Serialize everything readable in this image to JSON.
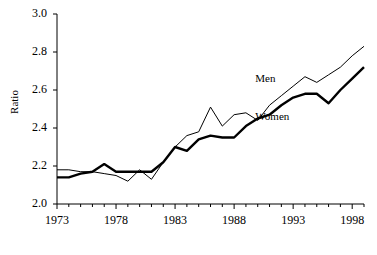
{
  "chart_data": {
    "type": "line",
    "title": "",
    "xlabel": "",
    "ylabel": "Ratio",
    "xlim": [
      1973,
      1999
    ],
    "ylim": [
      2.0,
      3.0
    ],
    "grid": false,
    "legend_position": "inline-annotation",
    "x": [
      1973,
      1974,
      1975,
      1976,
      1977,
      1978,
      1979,
      1980,
      1981,
      1982,
      1983,
      1984,
      1985,
      1986,
      1987,
      1988,
      1989,
      1990,
      1991,
      1992,
      1993,
      1994,
      1995,
      1996,
      1997,
      1998,
      1999
    ],
    "yticks": [
      "2.0",
      "2.2",
      "2.4",
      "2.6",
      "2.8",
      "3.0"
    ],
    "ytick_values": [
      2.0,
      2.2,
      2.4,
      2.6,
      2.8,
      3.0
    ],
    "xticks": [
      "1973",
      "1978",
      "1983",
      "1988",
      "1993",
      "1998"
    ],
    "xtick_values": [
      1973,
      1978,
      1983,
      1988,
      1993,
      1998
    ],
    "series": [
      {
        "name": "Men",
        "style": "thin",
        "color": "#000000",
        "values": [
          2.18,
          2.18,
          2.17,
          2.17,
          2.16,
          2.15,
          2.12,
          2.18,
          2.13,
          2.22,
          2.3,
          2.36,
          2.38,
          2.51,
          2.41,
          2.47,
          2.48,
          2.44,
          2.52,
          2.57,
          2.62,
          2.67,
          2.64,
          2.68,
          2.72,
          2.78,
          2.83
        ]
      },
      {
        "name": "Women",
        "style": "thick",
        "color": "#000000",
        "values": [
          2.14,
          2.14,
          2.16,
          2.17,
          2.21,
          2.17,
          2.17,
          2.17,
          2.17,
          2.22,
          2.3,
          2.28,
          2.34,
          2.36,
          2.35,
          2.35,
          2.41,
          2.45,
          2.47,
          2.52,
          2.56,
          2.58,
          2.58,
          2.53,
          2.6,
          2.66,
          2.72
        ]
      }
    ],
    "annotations": [
      {
        "text": "Men",
        "x": 1992.0,
        "y": 2.655
      },
      {
        "text": "Women",
        "x": 1992.0,
        "y": 2.455
      }
    ]
  }
}
